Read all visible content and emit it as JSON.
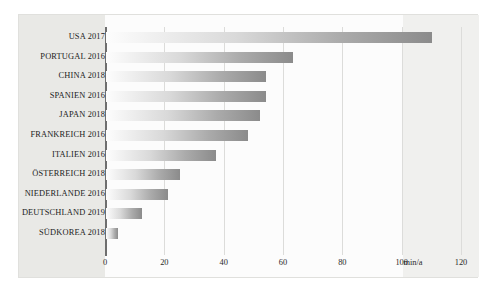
{
  "chart_data": {
    "type": "bar",
    "orientation": "horizontal",
    "title": "",
    "xlabel": "min/a",
    "ylabel": "",
    "unit": "min/a",
    "xlim": [
      0,
      120
    ],
    "xticks": [
      0,
      20,
      40,
      60,
      80,
      100,
      120
    ],
    "grid": true,
    "legend": "none",
    "categories": [
      "USA 2017",
      "PORTUGAL 2016",
      "CHINA 2018",
      "SPANIEN 2016",
      "JAPAN 2018",
      "FRANKREICH 2016",
      "ITALIEN 2016",
      "ÖSTERREICH 2018",
      "NIEDERLANDE 2016",
      "DEUTSCHLAND 2019",
      "SÜDKOREA 2018"
    ],
    "values": [
      110,
      63,
      54,
      54,
      52,
      48,
      37,
      25,
      21,
      12,
      4
    ],
    "bar_gradient_from": "#fdfdfd",
    "bar_gradient_to": "#8b8b8b",
    "axis_color": "#6e6e6e",
    "grid_color": "#dcdcda",
    "plot_background": "#fcfcfc",
    "label_gutter_background": "#e9e9e6"
  }
}
